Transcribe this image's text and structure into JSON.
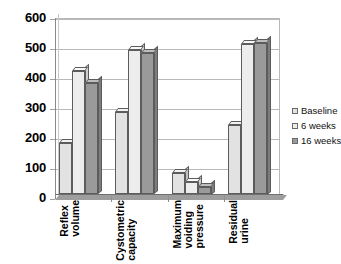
{
  "chart_data": {
    "type": "bar",
    "title": "",
    "subtitle": "",
    "xlabel": "",
    "ylabel": "",
    "ylim": [
      0,
      600
    ],
    "ytick_step": 100,
    "yticks": [
      600,
      500,
      400,
      300,
      200,
      100,
      0
    ],
    "grid": true,
    "legend_position": "right",
    "three_d": true,
    "categories": [
      "Reflex volume",
      "Cystometric capacity",
      "Maximum voiding pressure",
      "Residual urine"
    ],
    "category_words": [
      [
        "Reflex",
        "volume"
      ],
      [
        "Cystometric",
        "capacity"
      ],
      [
        "Maximum",
        "voiding",
        "pressure"
      ],
      [
        "Residual",
        "urine"
      ]
    ],
    "series": [
      {
        "name": "Baseline",
        "color": "#e2e2e2",
        "values": [
          170,
          275,
          70,
          230
        ]
      },
      {
        "name": "6 weeks",
        "color": "#ededed",
        "values": [
          410,
          480,
          40,
          500
        ]
      },
      {
        "name": "16 weeks",
        "color": "#9a9a9a",
        "values": [
          370,
          470,
          25,
          505
        ]
      }
    ]
  },
  "legend": {
    "items": [
      {
        "label": "Baseline"
      },
      {
        "label": "6 weeks"
      },
      {
        "label": "16 weeks"
      }
    ]
  },
  "axis": {
    "y_ticks": [
      "600",
      "500",
      "400",
      "300",
      "200",
      "100",
      "0"
    ]
  }
}
